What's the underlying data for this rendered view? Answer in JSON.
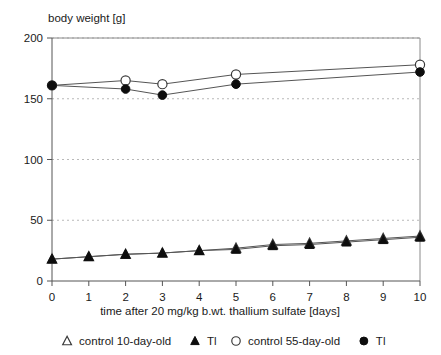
{
  "chart_data": {
    "type": "line",
    "title": "body weight [g]",
    "ylabel": "body weight [g]",
    "xlabel": "time after 20 mg/kg b.wt. thallium sulfate  [days]",
    "x": [
      0,
      1,
      2,
      3,
      4,
      5,
      6,
      7,
      8,
      9,
      10
    ],
    "xticklabels": [
      "0",
      "1",
      "2",
      "3",
      "4",
      "5",
      "6",
      "7",
      "8",
      "9",
      "10"
    ],
    "yticklabels": [
      "0",
      "50",
      "100",
      "150",
      "200"
    ],
    "yticks": [
      0,
      50,
      100,
      150,
      200
    ],
    "xlim": [
      0,
      10
    ],
    "ylim": [
      0,
      200
    ],
    "grid": "horizontal-dotted",
    "legend_position": "bottom",
    "series": [
      {
        "name": "control 10-day-old",
        "marker": "open-triangle",
        "x": [
          0,
          1,
          2,
          3,
          4,
          5,
          6,
          7,
          8,
          9,
          10
        ],
        "values": [
          18,
          20,
          22,
          23,
          25,
          27,
          30,
          31,
          33,
          35,
          37
        ]
      },
      {
        "name": "Tl",
        "marker": "filled-triangle",
        "x": [
          0,
          1,
          2,
          3,
          4,
          5,
          6,
          7,
          8,
          9,
          10
        ],
        "values": [
          18,
          20,
          22,
          23,
          25,
          26,
          29,
          30,
          32,
          34,
          36
        ]
      },
      {
        "name": "control 55-day-old",
        "marker": "open-circle",
        "x": [
          0,
          2,
          3,
          5,
          10
        ],
        "values": [
          161,
          165,
          162,
          170,
          178
        ]
      },
      {
        "name": "Tl",
        "marker": "filled-circle",
        "x": [
          0,
          2,
          3,
          5,
          10
        ],
        "values": [
          161,
          158,
          153,
          162,
          172
        ]
      }
    ],
    "legend": [
      {
        "marker": "open-triangle",
        "label": "control 10-day-old"
      },
      {
        "marker": "filled-triangle",
        "label": "Tl"
      },
      {
        "marker": "open-circle",
        "label": "control 55-day-old"
      },
      {
        "marker": "filled-circle",
        "label": "Tl"
      }
    ],
    "colors": {
      "line": "#555555",
      "marker_fill_open": "#ffffff",
      "marker_fill_solid": "#0d0d0d",
      "grid": "#b9b9b9",
      "axis": "#555555",
      "text": "#1a1a1a"
    }
  }
}
